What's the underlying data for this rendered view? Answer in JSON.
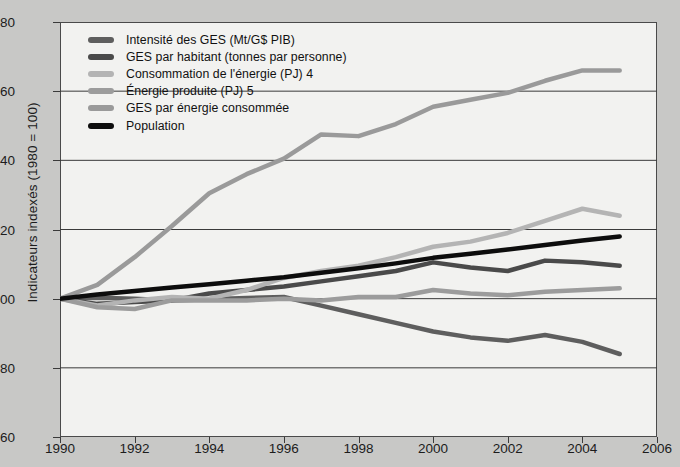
{
  "chart_data": {
    "type": "line",
    "title": "",
    "xlabel": "",
    "ylabel": "Indicateurs indexés (1980 = 100)",
    "xlim": [
      1990,
      2006
    ],
    "ylim": [
      60,
      180
    ],
    "xticks": [
      1990,
      1992,
      1994,
      1996,
      1998,
      2000,
      2002,
      2004,
      2006
    ],
    "yticks": [
      60,
      80,
      100,
      120,
      140,
      160,
      180
    ],
    "grid": "horizontal",
    "legend_position": "upper-left-inside",
    "x": [
      1990,
      1991,
      1992,
      1993,
      1994,
      1995,
      1996,
      1997,
      1998,
      1999,
      2000,
      2001,
      2002,
      2003,
      2004,
      2005
    ],
    "series": [
      {
        "name": "Intensité des GES (Mt/G$ PIB)",
        "color": "#5e5e5e",
        "values": [
          100.0,
          100.3,
          100.0,
          99.5,
          99.8,
          100.2,
          100.5,
          98.0,
          95.5,
          93.0,
          90.5,
          88.8,
          87.8,
          89.5,
          87.5,
          84.0
        ]
      },
      {
        "name": "GES par habitant (tonnes par personne)",
        "color": "#4a4a4a",
        "values": [
          100.0,
          98.5,
          99.0,
          99.5,
          101.5,
          102.5,
          103.5,
          105.0,
          106.5,
          108.0,
          110.5,
          109.0,
          108.0,
          111.0,
          110.5,
          109.5
        ]
      },
      {
        "name": "Consommation de l'énergie (PJ) 4",
        "color": "#b4b4b4",
        "values": [
          100.0,
          98.0,
          99.5,
          100.5,
          100.0,
          102.5,
          106.0,
          108.0,
          109.5,
          112.0,
          115.0,
          116.5,
          119.0,
          122.5,
          126.0,
          124.0
        ]
      },
      {
        "name": "Énergie produite (PJ) 5",
        "color": "#9c9c9c",
        "values": [
          100.0,
          97.5,
          97.0,
          99.5,
          99.5,
          99.5,
          100.0,
          99.5,
          100.5,
          100.5,
          102.5,
          101.5,
          101.0,
          102.0,
          102.5,
          103.0
        ]
      },
      {
        "name": "GES par énergie consommée",
        "color": "#9a9a9a",
        "values": [
          100.0,
          104.0,
          112.0,
          121.0,
          130.5,
          136.0,
          140.5,
          147.5,
          147.0,
          150.5,
          155.5,
          157.5,
          159.5,
          163.0,
          166.0,
          166.0
        ]
      },
      {
        "name": "Population",
        "color": "#0d0d0d",
        "values": [
          100.0,
          101.2,
          102.2,
          103.2,
          104.2,
          105.2,
          106.2,
          107.5,
          108.8,
          110.2,
          111.8,
          113.0,
          114.2,
          115.5,
          116.8,
          118.0
        ]
      }
    ]
  }
}
